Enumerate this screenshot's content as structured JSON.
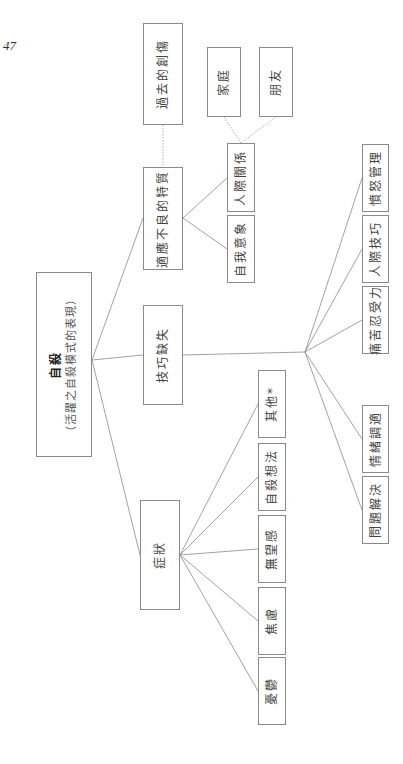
{
  "page_number": "47",
  "root": {
    "title": "自殺",
    "subtitle": "（活躍之自殺模式的表現）"
  },
  "branches": {
    "past_trauma": "過去的創傷",
    "maladaptive_traits": "適應不良的特質",
    "skill_deficits": "技巧缺失",
    "symptoms": "症狀"
  },
  "maladaptive_children": {
    "interpersonal": "人際關係",
    "self_image": "自我意象"
  },
  "interpersonal_children": {
    "family": "家庭",
    "friends": "朋友"
  },
  "symptom_children": [
    "其他*",
    "自殺想法",
    "無望感",
    "焦慮",
    "憂鬱"
  ],
  "skill_children": [
    "憤怒管理",
    "人際技巧",
    "痛苦忍受力",
    "情緒調適",
    "問題解決"
  ],
  "colors": {
    "line": "#8a8a8a",
    "dotted": "#999999",
    "border": "#8a8a8a"
  }
}
